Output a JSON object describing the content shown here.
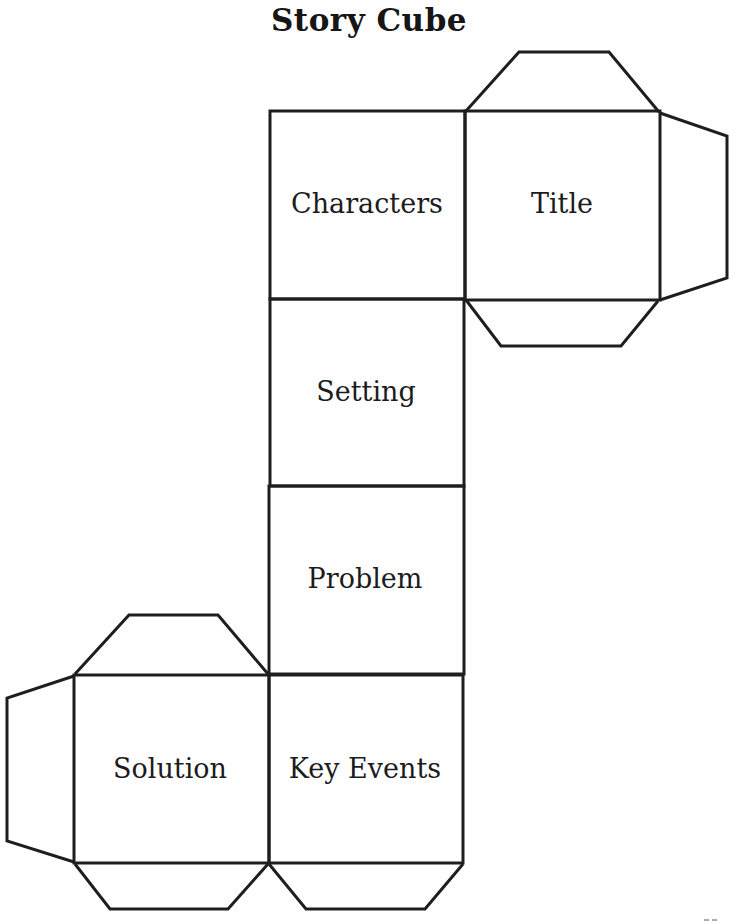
{
  "title": "Story Cube",
  "faces": [
    {
      "id": "characters",
      "label": "Characters"
    },
    {
      "id": "title",
      "label": "Title"
    },
    {
      "id": "setting",
      "label": "Setting"
    },
    {
      "id": "problem",
      "label": "Problem"
    },
    {
      "id": "solution",
      "label": "Solution"
    },
    {
      "id": "key-events",
      "label": "Key Events"
    }
  ],
  "flaps": [
    {
      "id": "title-top-flap",
      "attached_to": "title",
      "side": "top"
    },
    {
      "id": "title-right-flap",
      "attached_to": "title",
      "side": "right"
    },
    {
      "id": "title-bottom-flap",
      "attached_to": "title",
      "side": "bottom"
    },
    {
      "id": "solution-top-flap",
      "attached_to": "solution",
      "side": "top"
    },
    {
      "id": "solution-left-flap",
      "attached_to": "solution",
      "side": "left"
    },
    {
      "id": "solution-bottom-flap",
      "attached_to": "solution",
      "side": "bottom"
    },
    {
      "id": "key-events-bottom-flap",
      "attached_to": "key-events",
      "side": "bottom"
    }
  ],
  "line_color": "#1e1e1e"
}
